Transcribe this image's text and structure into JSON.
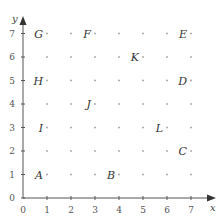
{
  "axes": {
    "x_label": "x",
    "y_label": "y",
    "x_ticks": [
      "0",
      "1",
      "2",
      "3",
      "4",
      "5",
      "6",
      "7"
    ],
    "y_ticks": [
      "0",
      "1",
      "2",
      "3",
      "4",
      "5",
      "6",
      "7"
    ],
    "xlim": [
      0,
      7
    ],
    "ylim": [
      0,
      7
    ]
  },
  "colors": {
    "axis": "#555555",
    "dot": "#aaaaaa",
    "label": "#333333"
  },
  "points": [
    {
      "label": "A",
      "x": 1,
      "y": 1
    },
    {
      "label": "B",
      "x": 4,
      "y": 1
    },
    {
      "label": "C",
      "x": 7,
      "y": 2
    },
    {
      "label": "D",
      "x": 7,
      "y": 5
    },
    {
      "label": "E",
      "x": 7,
      "y": 7
    },
    {
      "label": "F",
      "x": 3,
      "y": 7
    },
    {
      "label": "G",
      "x": 1,
      "y": 7
    },
    {
      "label": "H",
      "x": 1,
      "y": 5
    },
    {
      "label": "I",
      "x": 1,
      "y": 3
    },
    {
      "label": "J",
      "x": 3,
      "y": 4
    },
    {
      "label": "K",
      "x": 5,
      "y": 6
    },
    {
      "label": "L",
      "x": 6,
      "y": 3
    }
  ]
}
